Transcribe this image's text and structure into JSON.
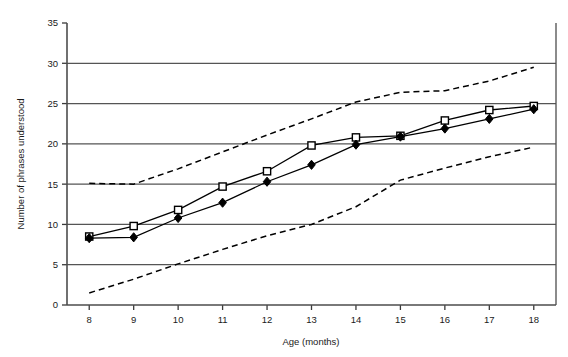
{
  "chart_data": {
    "type": "line",
    "title": "",
    "xlabel": "Age (months)",
    "ylabel": "Number of phrases understood",
    "x": [
      8,
      9,
      10,
      11,
      12,
      13,
      14,
      15,
      16,
      17,
      18
    ],
    "xticklabels": [
      "8",
      "9",
      "10",
      "11",
      "12",
      "13",
      "14",
      "15",
      "16",
      "17",
      "18"
    ],
    "yticklabels": [
      "0",
      "5",
      "10",
      "15",
      "20",
      "25",
      "30",
      "35"
    ],
    "xlim": [
      7.5,
      18.5
    ],
    "ylim": [
      0,
      35
    ],
    "ytick_step": 5,
    "grid": "horizontal",
    "legend": "none",
    "series": [
      {
        "name": "open-square-series",
        "marker": "open-square",
        "line": "solid",
        "color": "#000000",
        "values": [
          8.5,
          9.8,
          11.8,
          14.7,
          16.6,
          19.8,
          20.8,
          21.0,
          22.9,
          24.2,
          24.7
        ]
      },
      {
        "name": "filled-diamond-series",
        "marker": "filled-diamond",
        "line": "solid",
        "color": "#000000",
        "values": [
          8.3,
          8.4,
          10.8,
          12.7,
          15.3,
          17.4,
          19.9,
          20.9,
          21.9,
          23.1,
          24.3
        ]
      },
      {
        "name": "upper-bound",
        "marker": "none",
        "line": "dashed",
        "color": "#000000",
        "values": [
          15.1,
          15.0,
          16.9,
          19.0,
          21.1,
          23.1,
          25.2,
          26.4,
          26.6,
          27.8,
          29.5
        ]
      },
      {
        "name": "lower-bound",
        "marker": "none",
        "line": "dashed",
        "color": "#000000",
        "values": [
          1.5,
          3.2,
          5.1,
          6.9,
          8.6,
          10.0,
          12.2,
          15.5,
          17.0,
          18.4,
          19.6
        ]
      }
    ]
  }
}
